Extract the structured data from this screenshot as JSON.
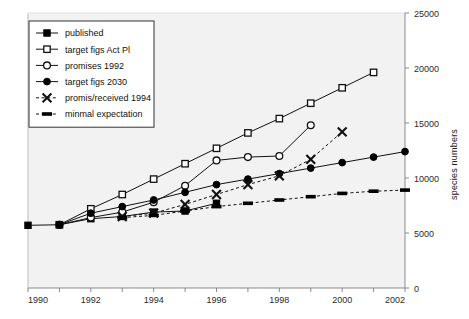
{
  "chart_data": {
    "type": "line",
    "title": "",
    "xlabel": "",
    "ylabel": "species numbers",
    "xlim": [
      1990,
      2002
    ],
    "ylim": [
      0,
      25000
    ],
    "xticks": [
      1990,
      1991,
      1992,
      1993,
      1994,
      1995,
      1996,
      1997,
      1998,
      1999,
      2000,
      2001,
      2002
    ],
    "xtick_labels": [
      "1990",
      "",
      "1992",
      "",
      "1994",
      "",
      "1996",
      "",
      "1998",
      "",
      "2000",
      "",
      "2002"
    ],
    "yticks": [
      0,
      5000,
      10000,
      15000,
      20000,
      25000
    ],
    "ytick_labels": [
      "0",
      "5000",
      "10000",
      "15000",
      "20000",
      "25000"
    ],
    "y_axis_position": "right",
    "grid": false,
    "legend_position": "top-left",
    "series": [
      {
        "name": "published",
        "marker": "filled-square",
        "linestyle": "solid",
        "x": [
          1990,
          1991,
          1992,
          1993,
          1994,
          1995,
          1996
        ],
        "values": [
          5700,
          5750,
          6300,
          6500,
          6900,
          7000,
          7700
        ]
      },
      {
        "name": "target figs Act Pl",
        "marker": "open-square",
        "linestyle": "solid",
        "x": [
          1991,
          1992,
          1993,
          1994,
          1995,
          1996,
          1997,
          1998,
          1999,
          2000,
          2001
        ],
        "values": [
          5750,
          7200,
          8500,
          9900,
          11300,
          12700,
          14100,
          15400,
          16800,
          18200,
          19600
        ]
      },
      {
        "name": "promises 1992",
        "marker": "open-circle",
        "linestyle": "solid",
        "x": [
          1991,
          1992,
          1993,
          1994,
          1995,
          1996,
          1997,
          1998,
          1999
        ],
        "values": [
          5750,
          6400,
          6900,
          7800,
          9300,
          11600,
          11900,
          12000,
          14800
        ]
      },
      {
        "name": "target figs 2030",
        "marker": "filled-circle",
        "linestyle": "solid",
        "x": [
          1991,
          1992,
          1993,
          1994,
          1995,
          1996,
          1997,
          1998,
          1999,
          2000,
          2001,
          2002
        ],
        "values": [
          5750,
          6800,
          7400,
          8000,
          8700,
          9400,
          9900,
          10400,
          10900,
          11400,
          11900,
          12400
        ]
      },
      {
        "name": "promis/received 1994",
        "marker": "cross-x",
        "linestyle": "dashed",
        "x": [
          1993,
          1994,
          1995,
          1996,
          1997,
          1998,
          1999,
          2000
        ],
        "values": [
          6500,
          6800,
          7600,
          8500,
          9400,
          10200,
          11700,
          14200
        ]
      },
      {
        "name": "minmal expectation",
        "marker": "thick-dash",
        "linestyle": "dashed",
        "x": [
          1993,
          1994,
          1995,
          1996,
          1997,
          1998,
          1999,
          2000,
          2001,
          2002
        ],
        "values": [
          6400,
          6600,
          7000,
          7400,
          7700,
          8000,
          8300,
          8600,
          8800,
          8900
        ]
      }
    ]
  },
  "legend": {
    "items": [
      {
        "label": "published"
      },
      {
        "label": "target figs Act Pl"
      },
      {
        "label": "promises 1992"
      },
      {
        "label": "target figs 2030"
      },
      {
        "label": "promis/received 1994"
      },
      {
        "label": "minmal expectation"
      }
    ]
  },
  "colors": {
    "line": "#111111",
    "marker_fill": "#000000",
    "marker_open": "#ffffff",
    "axis": "#777777",
    "tick_text": "#3a3a3a",
    "plot_bg": "#f2f2f2",
    "page_bg": "#ffffff"
  }
}
